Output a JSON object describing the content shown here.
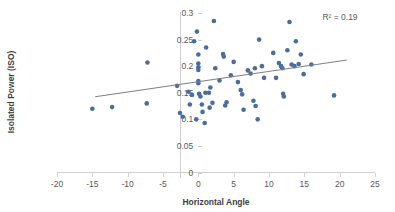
{
  "chart_data": {
    "type": "scatter",
    "title": "",
    "xlabel": "Horizontal Angle",
    "ylabel": "Isolated Power (ISO)",
    "xlim": [
      -20,
      25
    ],
    "ylim": [
      0,
      0.3
    ],
    "xticks": [
      -20,
      -15,
      -10,
      -5,
      0,
      5,
      10,
      15,
      20,
      25
    ],
    "xtick_labels": [
      "-20",
      "-15",
      "-10",
      "-5",
      "0",
      "5",
      "10",
      "15",
      "20",
      "25"
    ],
    "yticks": [
      0,
      0.05,
      0.1,
      0.15,
      0.2,
      0.25,
      0.3
    ],
    "ytick_labels": [
      "0",
      "0.05",
      "0.1",
      "0.15",
      "0.2",
      "0.25",
      "0.3"
    ],
    "grid": false,
    "legend": null,
    "marker_color": "#4a6d9c",
    "trendline_color": "#7f7f7f",
    "annotations": [
      {
        "text": "R² = 0.19",
        "x": 19.5,
        "y": 0.288
      }
    ],
    "trendline": {
      "x": [
        -14.6,
        21.0
      ],
      "y": [
        0.1425,
        0.2115
      ],
      "slope": 0.00194,
      "intercept": 0.1708,
      "r_squared": 0.19
    },
    "points": [
      {
        "x": -15.0,
        "y": 0.12
      },
      {
        "x": -12.2,
        "y": 0.123
      },
      {
        "x": -7.3,
        "y": 0.13
      },
      {
        "x": -7.2,
        "y": 0.207
      },
      {
        "x": -3.0,
        "y": 0.163
      },
      {
        "x": -2.6,
        "y": 0.112
      },
      {
        "x": -2.2,
        "y": 0.105
      },
      {
        "x": -1.4,
        "y": 0.152
      },
      {
        "x": -1.2,
        "y": 0.128
      },
      {
        "x": -0.9,
        "y": 0.146
      },
      {
        "x": -0.6,
        "y": 0.247
      },
      {
        "x": -0.3,
        "y": 0.1
      },
      {
        "x": -0.2,
        "y": 0.265
      },
      {
        "x": 0.0,
        "y": 0.222
      },
      {
        "x": 0.0,
        "y": 0.205
      },
      {
        "x": 0.0,
        "y": 0.198
      },
      {
        "x": 0.0,
        "y": 0.193
      },
      {
        "x": 0.0,
        "y": 0.172
      },
      {
        "x": 0.0,
        "y": 0.168
      },
      {
        "x": 0.1,
        "y": 0.148
      },
      {
        "x": 0.3,
        "y": 0.143
      },
      {
        "x": 0.5,
        "y": 0.128
      },
      {
        "x": 0.6,
        "y": 0.114
      },
      {
        "x": 0.9,
        "y": 0.093
      },
      {
        "x": 1.0,
        "y": 0.15
      },
      {
        "x": 1.1,
        "y": 0.235
      },
      {
        "x": 1.5,
        "y": 0.15
      },
      {
        "x": 1.6,
        "y": 0.122
      },
      {
        "x": 1.7,
        "y": 0.16
      },
      {
        "x": 2.0,
        "y": 0.131
      },
      {
        "x": 2.2,
        "y": 0.285
      },
      {
        "x": 2.4,
        "y": 0.196
      },
      {
        "x": 3.0,
        "y": 0.173
      },
      {
        "x": 3.5,
        "y": 0.223
      },
      {
        "x": 3.6,
        "y": 0.218
      },
      {
        "x": 3.8,
        "y": 0.126
      },
      {
        "x": 4.0,
        "y": 0.132
      },
      {
        "x": 4.6,
        "y": 0.183
      },
      {
        "x": 5.0,
        "y": 0.208
      },
      {
        "x": 5.6,
        "y": 0.17
      },
      {
        "x": 6.0,
        "y": 0.155
      },
      {
        "x": 6.2,
        "y": 0.147
      },
      {
        "x": 6.4,
        "y": 0.118
      },
      {
        "x": 7.0,
        "y": 0.192
      },
      {
        "x": 7.4,
        "y": 0.186
      },
      {
        "x": 7.8,
        "y": 0.135
      },
      {
        "x": 8.0,
        "y": 0.196
      },
      {
        "x": 8.1,
        "y": 0.125
      },
      {
        "x": 8.4,
        "y": 0.1
      },
      {
        "x": 8.6,
        "y": 0.25
      },
      {
        "x": 9.0,
        "y": 0.2
      },
      {
        "x": 9.3,
        "y": 0.178
      },
      {
        "x": 10.6,
        "y": 0.225
      },
      {
        "x": 11.0,
        "y": 0.178
      },
      {
        "x": 11.4,
        "y": 0.206
      },
      {
        "x": 11.7,
        "y": 0.2
      },
      {
        "x": 11.9,
        "y": 0.196
      },
      {
        "x": 12.0,
        "y": 0.148
      },
      {
        "x": 12.1,
        "y": 0.143
      },
      {
        "x": 12.6,
        "y": 0.23
      },
      {
        "x": 12.9,
        "y": 0.283
      },
      {
        "x": 13.2,
        "y": 0.203
      },
      {
        "x": 13.6,
        "y": 0.2
      },
      {
        "x": 13.8,
        "y": 0.247
      },
      {
        "x": 14.2,
        "y": 0.204
      },
      {
        "x": 14.5,
        "y": 0.222
      },
      {
        "x": 14.9,
        "y": 0.185
      },
      {
        "x": 16.0,
        "y": 0.203
      },
      {
        "x": 19.2,
        "y": 0.145
      }
    ]
  }
}
